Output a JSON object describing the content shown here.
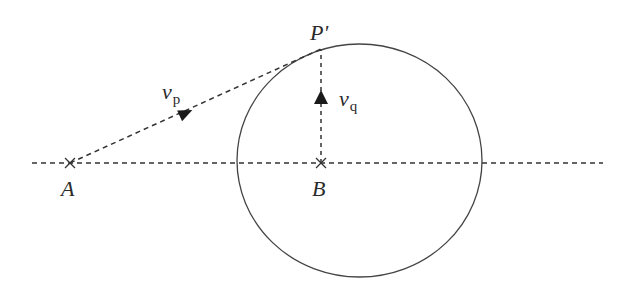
{
  "diagram": {
    "type": "geometry-physics",
    "colors": {
      "stroke": "#333333",
      "background": "#ffffff"
    },
    "points": {
      "A": {
        "label": "A",
        "x": 70,
        "y": 163,
        "marker": "cross"
      },
      "B": {
        "label": "B",
        "x": 321,
        "y": 163,
        "marker": "cross"
      },
      "P_prime": {
        "label": "P'",
        "x": 321,
        "y": 49
      }
    },
    "circle": {
      "cx": 359.5,
      "cy": 160.5,
      "rx": 122.5,
      "ry": 116.5
    },
    "axis_line": {
      "x1": 32,
      "y1": 163,
      "x2": 603,
      "y2": 163,
      "style": "dashed"
    },
    "vectors": {
      "vp": {
        "symbol": "v",
        "subscript": "p",
        "from": "A",
        "to": "P_prime",
        "style": "dashed"
      },
      "vq": {
        "symbol": "v",
        "subscript": "q",
        "from": "B",
        "to": "P_prime",
        "style": "dashed"
      }
    }
  }
}
